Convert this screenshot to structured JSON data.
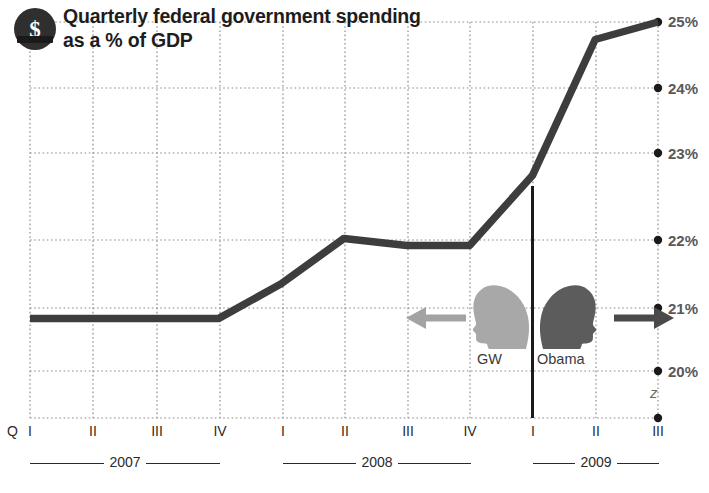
{
  "header": {
    "badge_icon": "dollar-coin-icon",
    "badge_glyph": "$",
    "title_line1": "Quarterly federal government spending",
    "title_line2": "as a % of GDP"
  },
  "axes": {
    "y_labels": [
      "25%",
      "24%",
      "23%",
      "22%",
      "21%",
      "20%"
    ],
    "x_prefix": "Q",
    "x_labels": [
      "I",
      "II",
      "III",
      "IV",
      "I",
      "II",
      "III",
      "IV",
      "I",
      "II",
      "III"
    ],
    "years": [
      "2007",
      "2008",
      "2009"
    ]
  },
  "annotations": {
    "gw_label": "GW",
    "obama_label": "Obama",
    "left_arrow_icon": "arrow-left-icon",
    "right_arrow_icon": "arrow-right-icon",
    "gw_head_icon": "head-silhouette-icon",
    "obama_head_icon": "head-silhouette-icon",
    "z_mark": "z"
  },
  "colors": {
    "line": "#3d3d3d",
    "grid": "#8c8c8c",
    "badge": "#2f2f2f",
    "gw_head": "#a8a8a8",
    "obama_head": "#5c5c5c",
    "text": "#1d1d1d",
    "ylabel": "#595959"
  },
  "chart_data": {
    "type": "line",
    "title": "Quarterly federal government spending as a % of GDP",
    "xlabel": "",
    "ylabel": "% of GDP",
    "ylim": [
      19.6,
      25.15
    ],
    "grid": true,
    "legend": false,
    "categories": [
      "2007 Q I",
      "2007 Q II",
      "2007 Q III",
      "2007 Q IV",
      "2008 Q I",
      "2008 Q II",
      "2008 Q III",
      "2008 Q IV",
      "2009 Q I",
      "2009 Q II",
      "2009 Q III"
    ],
    "values": [
      20.75,
      20.75,
      20.75,
      20.75,
      21.25,
      21.9,
      21.8,
      21.8,
      22.8,
      24.75,
      25.0
    ],
    "series": [
      {
        "name": "Federal spending as % of GDP",
        "values": [
          20.75,
          20.75,
          20.75,
          20.75,
          21.25,
          21.9,
          21.8,
          21.8,
          22.8,
          24.75,
          25.0
        ]
      }
    ],
    "ytick_values": [
      25,
      24,
      23,
      22,
      21,
      20
    ],
    "annotations": [
      {
        "text": "GW",
        "at": "2008 Q IV",
        "note": "George W. Bush administration, arrow pointing left"
      },
      {
        "text": "Obama",
        "at": "2009 Q I",
        "note": "Obama administration, arrow pointing right"
      }
    ]
  }
}
